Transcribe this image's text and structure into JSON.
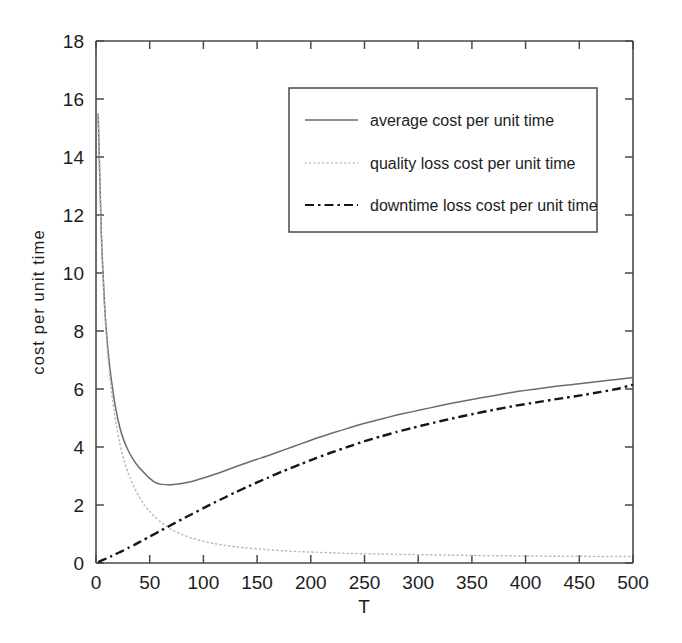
{
  "chart_data": {
    "type": "line",
    "title": "",
    "xlabel": "T",
    "ylabel": "cost per unit time",
    "xlim": [
      0,
      500
    ],
    "ylim": [
      0,
      18
    ],
    "xticks": [
      0,
      50,
      100,
      150,
      200,
      250,
      300,
      350,
      400,
      450,
      500
    ],
    "yticks": [
      0,
      2,
      4,
      6,
      8,
      10,
      12,
      14,
      16,
      18
    ],
    "xtick_labels": [
      "0",
      "50",
      "100",
      "150",
      "200",
      "250",
      "300",
      "350",
      "400",
      "450",
      "500"
    ],
    "ytick_labels": [
      "0",
      "2",
      "4",
      "6",
      "8",
      "10",
      "12",
      "14",
      "16",
      "18"
    ],
    "grid": false,
    "legend_position": "upper right",
    "legend_entries": [
      "average cost per unit time",
      "quality loss cost per unit time",
      "downtime loss cost per unit time"
    ],
    "x": [
      2,
      5,
      8,
      11,
      14,
      18,
      22,
      26,
      30,
      35,
      40,
      45,
      50,
      55,
      60,
      70,
      80,
      90,
      100,
      110,
      120,
      130,
      140,
      150,
      160,
      175,
      190,
      205,
      220,
      235,
      250,
      265,
      280,
      295,
      310,
      330,
      350,
      370,
      390,
      410,
      430,
      450,
      470,
      485,
      500
    ],
    "series": [
      {
        "name": "average cost per unit time",
        "style": "solid",
        "color": "#6b6b6b",
        "values": [
          15.5,
          11.3,
          8.9,
          7.4,
          6.4,
          5.4,
          4.7,
          4.22,
          3.88,
          3.55,
          3.3,
          3.1,
          2.92,
          2.78,
          2.72,
          2.7,
          2.74,
          2.82,
          2.93,
          3.05,
          3.18,
          3.32,
          3.45,
          3.58,
          3.7,
          3.9,
          4.1,
          4.3,
          4.48,
          4.65,
          4.82,
          4.96,
          5.1,
          5.22,
          5.34,
          5.5,
          5.64,
          5.77,
          5.9,
          6.0,
          6.1,
          6.18,
          6.27,
          6.33,
          6.4
        ]
      },
      {
        "name": "quality loss cost per unit time",
        "style": "dotted",
        "color": "#b9b9b9",
        "values": [
          15.45,
          11.2,
          8.75,
          7.15,
          6.05,
          4.95,
          4.15,
          3.55,
          3.1,
          2.65,
          2.3,
          2.0,
          1.78,
          1.58,
          1.42,
          1.16,
          0.98,
          0.85,
          0.75,
          0.67,
          0.61,
          0.56,
          0.52,
          0.49,
          0.46,
          0.42,
          0.39,
          0.37,
          0.35,
          0.33,
          0.32,
          0.31,
          0.3,
          0.29,
          0.28,
          0.27,
          0.26,
          0.25,
          0.245,
          0.24,
          0.235,
          0.23,
          0.225,
          0.22,
          0.22
        ]
      },
      {
        "name": "downtime loss cost per unit time",
        "style": "dashdot",
        "color": "#161616",
        "values": [
          0.03,
          0.08,
          0.13,
          0.18,
          0.23,
          0.3,
          0.37,
          0.44,
          0.52,
          0.61,
          0.71,
          0.81,
          0.91,
          1.01,
          1.11,
          1.31,
          1.51,
          1.7,
          1.89,
          2.08,
          2.26,
          2.44,
          2.61,
          2.78,
          2.94,
          3.18,
          3.4,
          3.62,
          3.82,
          4.01,
          4.2,
          4.36,
          4.52,
          4.66,
          4.8,
          4.97,
          5.13,
          5.28,
          5.42,
          5.54,
          5.66,
          5.77,
          5.9,
          6.0,
          6.15
        ]
      }
    ]
  },
  "axes": {
    "ylabel": "cost per unit time",
    "xlabel": "T"
  },
  "legend": {
    "items": [
      {
        "label": "average cost per unit time",
        "style": "solid"
      },
      {
        "label": "quality loss cost per unit time",
        "style": "dotted"
      },
      {
        "label": "downtime loss cost per unit time",
        "style": "dashdot"
      }
    ]
  }
}
